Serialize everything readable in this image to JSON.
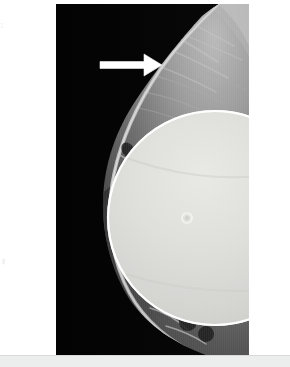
{
  "figure": {
    "modality": "mammogram",
    "view_description": "Mediolateral oblique mammogram of a breast containing a round radiopaque implant",
    "background_color": "#ffffff",
    "panel_background_color": "#000000",
    "footer_strip_color": "#eceded"
  },
  "panel": {
    "name": "radiograph-panel",
    "left": 56,
    "top": 4,
    "width": 193,
    "height": 351
  },
  "annotations": {
    "arrow": {
      "label": "",
      "semantic": "pointer-arrow",
      "color": "#ffffff",
      "direction": "right",
      "tail_x": 44,
      "tip_x": 106,
      "y": 61,
      "shaft_thickness": 7,
      "head_length": 18,
      "head_half_height": 11,
      "points_to": "axillary soft tissue density superior to the implant"
    }
  },
  "implant": {
    "semantic": "breast-implant",
    "shape": "circle",
    "center_x": 159,
    "center_y": 214,
    "radius": 108,
    "fill_color": "#d9dad6",
    "rim_color": "#fdfdfb",
    "rim_thickness": 3,
    "valve": {
      "semantic": "implant-valve-marker",
      "center_x": 131,
      "center_y": 214,
      "outer_radius": 5,
      "ring_color": "#f2f2ef",
      "inner_color": "#cfd0cc"
    }
  },
  "anatomy": {
    "skin_line_color": "#cfcfcf",
    "fibroglandular_color": "#9a9a9a",
    "fat_color": "#4a4a4a",
    "pectoral_color": "#8e8e8e",
    "background_color": "#050505"
  },
  "film_markers": {
    "top_marker": "⌶",
    "mid_marker": "⦀"
  }
}
